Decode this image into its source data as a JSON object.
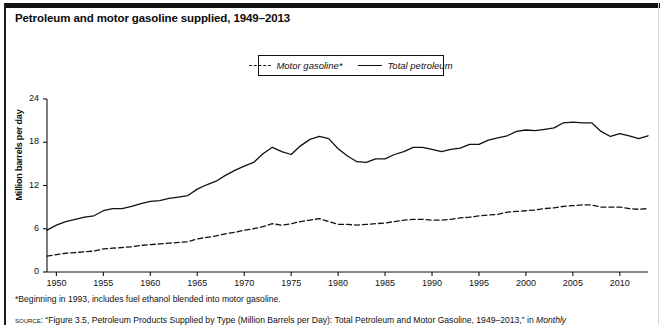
{
  "figure": {
    "title": "Petroleum and motor gasoline supplied, 1949–2013",
    "footnote": "*Beginning in 1993, includes fuel ethanol blended into motor gasoline.",
    "source_prefix": "source:",
    "source_text": " “Figure 3.5, Petroleum Products Supplied by Type (Million Barrels per Day): Total Petroleum and Motor Gasoline, 1949–2013,” in ",
    "source_italic": "Monthly"
  },
  "legend": {
    "items": [
      {
        "label": "Motor gasoline*",
        "style": "dashed"
      },
      {
        "label": "Total petroleum",
        "style": "solid"
      }
    ]
  },
  "axes": {
    "ylabel": "Million barrels per day",
    "yticks": [
      "0",
      "6",
      "12",
      "18",
      "24"
    ],
    "xticks": [
      "1950",
      "1955",
      "1960",
      "1965",
      "1970",
      "1975",
      "1980",
      "1985",
      "1990",
      "1995",
      "2000",
      "2005",
      "2010"
    ]
  },
  "chart_data": {
    "type": "line",
    "title": "Petroleum and motor gasoline supplied, 1949–2013",
    "xlabel": "",
    "ylabel": "Million barrels per day",
    "xlim": [
      1949,
      2013
    ],
    "ylim": [
      0,
      24
    ],
    "grid": false,
    "legend_position": "top-center",
    "annotations": [
      "*Beginning in 1993, includes fuel ethanol blended into motor gasoline."
    ],
    "x": [
      1949,
      1950,
      1951,
      1952,
      1953,
      1954,
      1955,
      1956,
      1957,
      1958,
      1959,
      1960,
      1961,
      1962,
      1963,
      1964,
      1965,
      1966,
      1967,
      1968,
      1969,
      1970,
      1971,
      1972,
      1973,
      1974,
      1975,
      1976,
      1977,
      1978,
      1979,
      1980,
      1981,
      1982,
      1983,
      1984,
      1985,
      1986,
      1987,
      1988,
      1989,
      1990,
      1991,
      1992,
      1993,
      1994,
      1995,
      1996,
      1997,
      1998,
      1999,
      2000,
      2001,
      2002,
      2003,
      2004,
      2005,
      2006,
      2007,
      2008,
      2009,
      2010,
      2011,
      2012,
      2013
    ],
    "series": [
      {
        "name": "Total petroleum",
        "style": "solid",
        "values": [
          5.8,
          6.5,
          7.0,
          7.3,
          7.6,
          7.8,
          8.5,
          8.8,
          8.8,
          9.1,
          9.5,
          9.8,
          9.9,
          10.2,
          10.4,
          10.6,
          11.5,
          12.1,
          12.6,
          13.4,
          14.1,
          14.7,
          15.2,
          16.4,
          17.3,
          16.7,
          16.3,
          17.5,
          18.4,
          18.8,
          18.5,
          17.1,
          16.1,
          15.3,
          15.2,
          15.7,
          15.7,
          16.3,
          16.7,
          17.3,
          17.3,
          17.0,
          16.7,
          17.0,
          17.2,
          17.7,
          17.7,
          18.3,
          18.6,
          18.9,
          19.5,
          19.7,
          19.6,
          19.8,
          20.0,
          20.7,
          20.8,
          20.7,
          20.7,
          19.5,
          18.8,
          19.2,
          18.9,
          18.5,
          18.9
        ]
      },
      {
        "name": "Motor gasoline*",
        "style": "dashed",
        "values": [
          2.2,
          2.4,
          2.6,
          2.7,
          2.8,
          2.9,
          3.2,
          3.3,
          3.4,
          3.5,
          3.7,
          3.8,
          3.9,
          4.0,
          4.1,
          4.2,
          4.6,
          4.8,
          5.0,
          5.3,
          5.5,
          5.8,
          6.0,
          6.3,
          6.7,
          6.5,
          6.7,
          7.0,
          7.2,
          7.4,
          7.0,
          6.6,
          6.6,
          6.5,
          6.6,
          6.7,
          6.8,
          7.0,
          7.2,
          7.3,
          7.3,
          7.2,
          7.2,
          7.3,
          7.5,
          7.6,
          7.8,
          7.9,
          8.0,
          8.3,
          8.4,
          8.5,
          8.6,
          8.8,
          8.9,
          9.1,
          9.2,
          9.3,
          9.3,
          9.0,
          9.0,
          9.0,
          8.8,
          8.7,
          8.8
        ]
      }
    ]
  }
}
